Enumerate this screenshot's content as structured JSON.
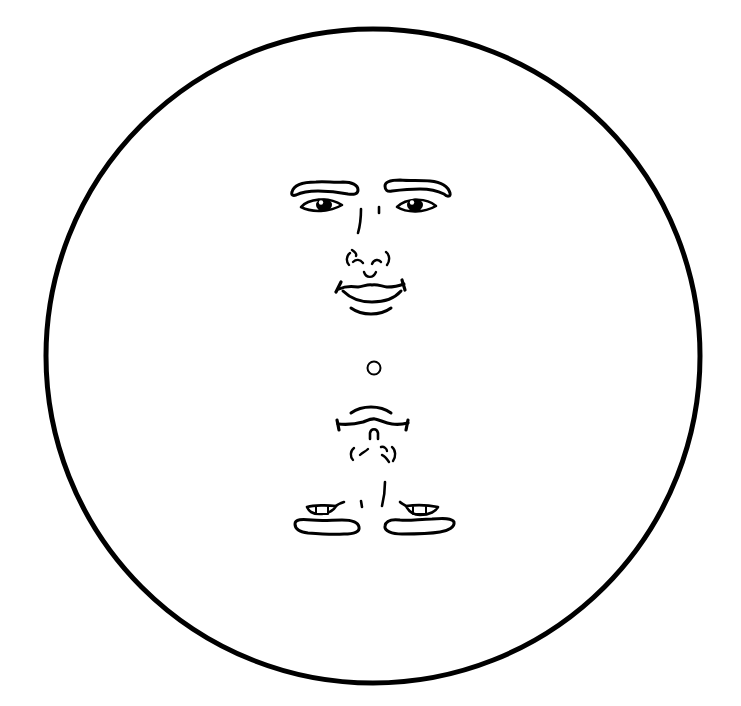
{
  "illustration": {
    "title": "Reversible face drawing",
    "description": "Line drawing inside a circle: an upright smiling face on top and an upside-down face below, with a small ring at the center",
    "colors": {
      "background": "#ffffff",
      "ink": "#000000"
    },
    "circle": {
      "cx": 373,
      "cy": 356,
      "r": 327,
      "stroke_width": 5
    },
    "center_ring": {
      "cx": 374,
      "cy": 368,
      "r": 6.5,
      "stroke_width": 2
    },
    "faces": [
      {
        "name": "upright-face",
        "orientation": "upright",
        "features": [
          "left-eyebrow",
          "right-eyebrow",
          "left-eye",
          "right-eye",
          "nose",
          "nostrils",
          "smiling-mouth",
          "chin-line"
        ]
      },
      {
        "name": "inverted-face",
        "orientation": "upside-down",
        "features": [
          "chin-line",
          "mouth",
          "nose-tip",
          "nostrils",
          "nose-bridge",
          "left-eye",
          "right-eye",
          "left-eyebrow",
          "right-eyebrow"
        ]
      }
    ]
  }
}
